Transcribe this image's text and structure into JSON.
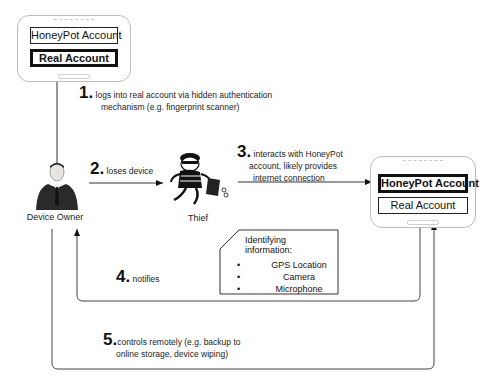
{
  "left_device": {
    "accounts": [
      {
        "label": "HoneyPot Account",
        "highlighted": false
      },
      {
        "label": "Real Account",
        "highlighted": true
      }
    ]
  },
  "right_device": {
    "accounts": [
      {
        "label": "HoneyPot Account",
        "highlighted": true
      },
      {
        "label": "Real Account",
        "highlighted": false
      }
    ]
  },
  "actors": {
    "owner": "Device Owner",
    "thief": "Thief"
  },
  "steps": [
    {
      "num": "1.",
      "line1": "logs into real account via hidden authentication",
      "line2": "mechanism (e.g. fingerprint scanner)"
    },
    {
      "num": "2.",
      "line1": "loses device"
    },
    {
      "num": "3.",
      "line1": "interacts with HoneyPot",
      "line2": "account, likely provides",
      "line3": "internet connection"
    },
    {
      "num": "4.",
      "line1": "notifies"
    },
    {
      "num": "5.",
      "line1": "controls remotely (e.g. backup to",
      "line2": "online storage, device wiping)"
    }
  ],
  "identifying_info": {
    "title": "Identifying information:",
    "items": [
      "GPS Location",
      "Camera",
      "Microphone"
    ]
  }
}
